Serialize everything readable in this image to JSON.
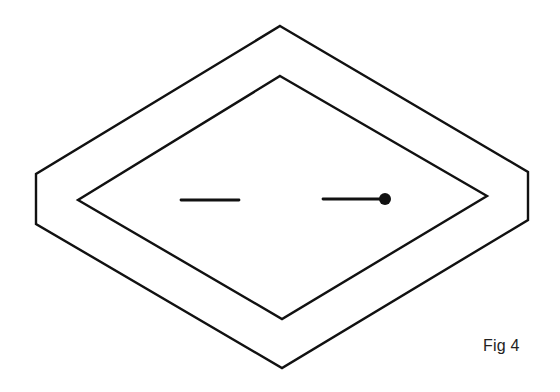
{
  "figure": {
    "caption": "Fig 4",
    "stroke_color": "#111111",
    "background": "#ffffff",
    "outer_frame": {
      "shape": "flattened-hexagon",
      "points": [
        [
          280,
          26
        ],
        [
          528,
          172
        ],
        [
          528,
          220
        ],
        [
          282,
          368
        ],
        [
          36,
          224
        ],
        [
          36,
          174
        ]
      ]
    },
    "inner_diamond": {
      "shape": "rhombus",
      "points": [
        [
          280,
          76
        ],
        [
          487,
          196
        ],
        [
          282,
          319
        ],
        [
          78,
          200
        ]
      ]
    },
    "left_dash": {
      "x1": 181,
      "y1": 200,
      "x2": 239,
      "y2": 200
    },
    "right_dash": {
      "x1": 323,
      "y1": 199,
      "x2": 380,
      "y2": 199
    },
    "end_dot": {
      "cx": 385,
      "cy": 199,
      "r": 6
    }
  }
}
